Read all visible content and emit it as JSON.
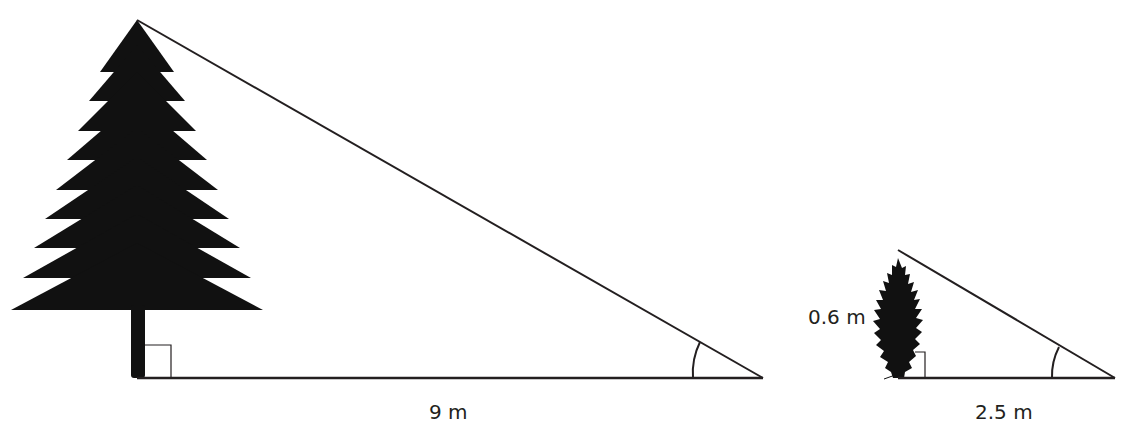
{
  "diagram": {
    "large_triangle": {
      "object": "tall-tree",
      "base_label": "9 m",
      "right_angle_marker": true,
      "angle_marker": true
    },
    "small_triangle": {
      "object": "small-shrub",
      "height_label": "0.6 m",
      "base_label": "2.5 m",
      "right_angle_marker": true,
      "angle_marker": true
    },
    "colors": {
      "ink": "#231f20",
      "silhouette": "#111111",
      "background": "#ffffff"
    }
  }
}
